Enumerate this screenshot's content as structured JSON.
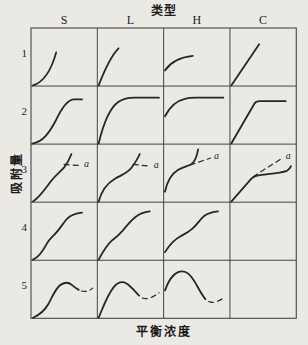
{
  "title": "类型",
  "y_axis_label": "吸附量",
  "x_axis_label": "平衡浓度",
  "columns": [
    "S",
    "L",
    "H",
    "C"
  ],
  "rows": [
    "1",
    "2",
    "3",
    "4",
    "5"
  ],
  "annotation_label": "a",
  "colors": {
    "background": "#ebe9e4",
    "grid_line": "#454545",
    "curve": "#262626",
    "text": "#1b1b1b"
  },
  "cells": [
    {
      "id": "S1",
      "col": "S",
      "row": "1",
      "curve": "convex accelerating rise from origin",
      "annotation": ""
    },
    {
      "id": "L1",
      "col": "L",
      "row": "1",
      "curve": "concave rise from origin, decreasing slope",
      "annotation": ""
    },
    {
      "id": "H1",
      "col": "H",
      "row": "1",
      "curve": "starts above origin on axis, short concave rise",
      "annotation": ""
    },
    {
      "id": "C1",
      "col": "C",
      "row": "1",
      "curve": "straight linear rise from origin",
      "annotation": ""
    },
    {
      "id": "S2",
      "col": "S",
      "row": "2",
      "curve": "sigmoid rise reaching plateau",
      "annotation": ""
    },
    {
      "id": "L2",
      "col": "L",
      "row": "2",
      "curve": "concave rise reaching plateau",
      "annotation": ""
    },
    {
      "id": "H2",
      "col": "H",
      "row": "2",
      "curve": "starts above origin, concave rise to plateau",
      "annotation": ""
    },
    {
      "id": "C2",
      "col": "C",
      "row": "2",
      "curve": "linear rise with sharp bend to plateau",
      "annotation": ""
    },
    {
      "id": "S3",
      "col": "S",
      "row": "3",
      "curve": "sigmoid rise, shoulder, renewed rise; dashed horizontal branch",
      "annotation": "a"
    },
    {
      "id": "L3",
      "col": "L",
      "row": "3",
      "curve": "concave rise, shoulder, renewed rise; dashed horizontal branch",
      "annotation": "a"
    },
    {
      "id": "H3",
      "col": "H",
      "row": "3",
      "curve": "high start, plateau shoulder, steep end rise; dashed rising branch",
      "annotation": "a"
    },
    {
      "id": "C3",
      "col": "C",
      "row": "3",
      "curve": "linear rise, long shallow plateau, end upturn; dashed rising branch",
      "annotation": "a"
    },
    {
      "id": "S4",
      "col": "S",
      "row": "4",
      "curve": "two-step stepped rise",
      "annotation": ""
    },
    {
      "id": "L4",
      "col": "L",
      "row": "4",
      "curve": "two-step stepped rise",
      "annotation": ""
    },
    {
      "id": "H4",
      "col": "H",
      "row": "4",
      "curve": "high start, two-step stepped rise",
      "annotation": ""
    },
    {
      "id": "C4",
      "col": "C",
      "row": "4",
      "curve": "empty",
      "annotation": ""
    },
    {
      "id": "S5",
      "col": "S",
      "row": "5",
      "curve": "rise to maximum then decline, dashed tail",
      "annotation": ""
    },
    {
      "id": "L5",
      "col": "L",
      "row": "5",
      "curve": "rise to broad maximum then decline, dashed rising tail",
      "annotation": ""
    },
    {
      "id": "H5",
      "col": "H",
      "row": "5",
      "curve": "high start, rise to maximum then steep decline, dashed tail",
      "annotation": ""
    },
    {
      "id": "C5",
      "col": "C",
      "row": "5",
      "curve": "empty",
      "annotation": ""
    }
  ]
}
